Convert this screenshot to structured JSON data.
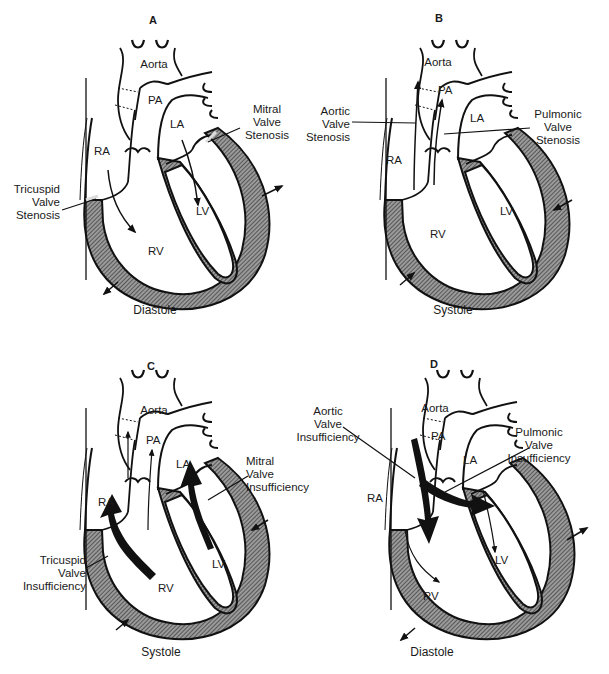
{
  "figure": {
    "colors": {
      "line": "#111111",
      "wall_fill": "#7a7a7a",
      "background": "#ffffff"
    }
  },
  "panels": [
    {
      "id": "A",
      "letter": "A",
      "phase": "Diastole",
      "chambers": {
        "aorta": "Aorta",
        "pa": "PA",
        "la": "LA",
        "ra": "RA",
        "lv": "LV",
        "rv": "RV"
      },
      "callouts": [
        {
          "name": "tricuspid-valve-stenosis",
          "text": "Tricuspid\nValve\nStenosis"
        },
        {
          "name": "mitral-valve-stenosis",
          "text": "Mitral\nValve\nStenosis"
        }
      ],
      "wall_motion": "outward"
    },
    {
      "id": "B",
      "letter": "B",
      "phase": "Systole",
      "chambers": {
        "aorta": "Aorta",
        "pa": "PA",
        "la": "LA",
        "ra": "RA",
        "lv": "LV",
        "rv": "RV"
      },
      "callouts": [
        {
          "name": "aortic-valve-stenosis",
          "text": "Aortic\nValve\nStenosis"
        },
        {
          "name": "pulmonic-valve-stenosis",
          "text": "Pulmonic\nValve\nStenosis"
        }
      ],
      "wall_motion": "inward"
    },
    {
      "id": "C",
      "letter": "C",
      "phase": "Systole",
      "chambers": {
        "aorta": "Aorta",
        "pa": "PA",
        "la": "LA",
        "ra": "RA",
        "lv": "LV",
        "rv": "RV"
      },
      "callouts": [
        {
          "name": "mitral-valve-insufficiency",
          "text": "Mitral\nValve\nInsufficiency"
        },
        {
          "name": "tricuspid-valve-insufficiency",
          "text": "Tricuspid\nValve\nInsufficiency"
        }
      ],
      "wall_motion": "inward"
    },
    {
      "id": "D",
      "letter": "D",
      "phase": "Diastole",
      "chambers": {
        "aorta": "Aorta",
        "pa": "PA",
        "la": "LA",
        "ra": "RA",
        "lv": "LV",
        "rv": "RV"
      },
      "callouts": [
        {
          "name": "aortic-valve-insufficiency",
          "text": "Aortic\nValve\nInsufficiency"
        },
        {
          "name": "pulmonic-valve-insufficiency",
          "text": "Pulmonic\nValve\nInsufficiency"
        }
      ],
      "wall_motion": "outward"
    }
  ]
}
